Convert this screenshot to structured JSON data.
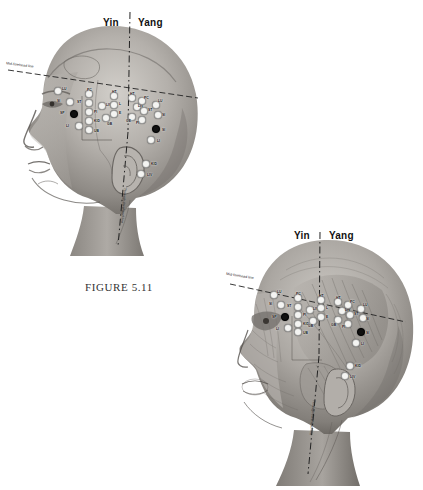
{
  "page": {
    "background": "#ffffff",
    "figure_caption": "FIGURE 5.11"
  },
  "labels": {
    "yin": "Yin",
    "yang": "Yang",
    "mid_forehead_line": "Mid-forehead line",
    "through_forehead_line": "Through-forehead line"
  },
  "colors": {
    "point_light": "#f4f4f2",
    "point_dark": "#101010",
    "line": "#2b2b2b",
    "text": "#111111",
    "skin_light": "#c9c6c1",
    "skin_mid": "#9a9691",
    "skin_dark": "#6e6a65"
  },
  "figures": [
    {
      "id": "figure-top",
      "view": "surface-anatomy-lateral-head",
      "caption": "FIGURE 5.11",
      "points": [
        {
          "label": "LU",
          "x": 57,
          "y": 90,
          "tone": "light",
          "lx": 62,
          "ly": 87
        },
        {
          "label": "SI",
          "x": 69,
          "y": 101,
          "tone": "light",
          "lx": 57,
          "ly": 99
        },
        {
          "label": "SP",
          "x": 73,
          "y": 113,
          "tone": "dark",
          "lx": 60,
          "ly": 111
        },
        {
          "label": "LI",
          "x": 78,
          "y": 125,
          "tone": "light",
          "lx": 66,
          "ly": 124
        },
        {
          "label": "PC",
          "x": 88,
          "y": 93,
          "tone": "light",
          "lx": 87,
          "ly": 88
        },
        {
          "label": "ST",
          "x": 88,
          "y": 102,
          "tone": "light",
          "lx": 77,
          "ly": 100
        },
        {
          "label": "PI",
          "x": 88,
          "y": 111,
          "tone": "light",
          "lx": 94,
          "ly": 110
        },
        {
          "label": "KID",
          "x": 88,
          "y": 120,
          "tone": "light",
          "lx": 94,
          "ly": 119
        },
        {
          "label": "UB",
          "x": 88,
          "y": 129,
          "tone": "light",
          "lx": 94,
          "ly": 129
        },
        {
          "label": "LIV",
          "x": 101,
          "y": 105,
          "tone": "light",
          "lx": 106,
          "ly": 103
        },
        {
          "label": "GB",
          "x": 105,
          "y": 117,
          "tone": "light",
          "lx": 107,
          "ly": 122
        },
        {
          "label": "HT",
          "x": 113,
          "y": 95,
          "tone": "light",
          "lx": 112,
          "ly": 90
        },
        {
          "label": "L",
          "x": 113,
          "y": 104,
          "tone": "light",
          "lx": 119,
          "ly": 102
        },
        {
          "label": "E",
          "x": 113,
          "y": 113,
          "tone": "light",
          "lx": 119,
          "ly": 111
        },
        {
          "label": "HT",
          "x": 131,
          "y": 97,
          "tone": "light",
          "lx": 130,
          "ly": 92
        },
        {
          "label": "LIV",
          "x": 136,
          "y": 106,
          "tone": "light",
          "lx": 138,
          "ly": 104
        },
        {
          "label": "GE",
          "x": 131,
          "y": 116,
          "tone": "light",
          "lx": 126,
          "ly": 119
        },
        {
          "label": "PC",
          "x": 141,
          "y": 100,
          "tone": "light",
          "lx": 144,
          "ly": 96
        },
        {
          "label": "ST",
          "x": 143,
          "y": 110,
          "tone": "light",
          "lx": 148,
          "ly": 108
        },
        {
          "label": "PI",
          "x": 141,
          "y": 119,
          "tone": "light",
          "lx": 136,
          "ly": 121
        },
        {
          "label": "LU",
          "x": 155,
          "y": 104,
          "tone": "light",
          "lx": 158,
          "ly": 99
        },
        {
          "label": "SI",
          "x": 157,
          "y": 114,
          "tone": "light",
          "lx": 162,
          "ly": 113
        },
        {
          "label": "SI",
          "x": 155,
          "y": 128,
          "tone": "dark",
          "lx": 162,
          "ly": 128
        },
        {
          "label": "LI",
          "x": 150,
          "y": 139,
          "tone": "light",
          "lx": 157,
          "ly": 139
        },
        {
          "label": "KID",
          "x": 145,
          "y": 163,
          "tone": "light",
          "lx": 151,
          "ly": 162
        },
        {
          "label": "LIV",
          "x": 140,
          "y": 173,
          "tone": "light",
          "lx": 147,
          "ly": 173
        }
      ]
    },
    {
      "id": "figure-bottom",
      "view": "muscular-anatomy-lateral-head",
      "caption": "",
      "points": [
        {
          "label": "LU",
          "x": 273,
          "y": 294,
          "tone": "light",
          "lx": 277,
          "ly": 290
        },
        {
          "label": "SI",
          "x": 280,
          "y": 304,
          "tone": "light",
          "lx": 269,
          "ly": 302
        },
        {
          "label": "SP",
          "x": 284,
          "y": 316,
          "tone": "dark",
          "lx": 272,
          "ly": 315
        },
        {
          "label": "LI",
          "x": 287,
          "y": 327,
          "tone": "light",
          "lx": 276,
          "ly": 327
        },
        {
          "label": "PC",
          "x": 297,
          "y": 297,
          "tone": "light",
          "lx": 296,
          "ly": 292
        },
        {
          "label": "ST",
          "x": 297,
          "y": 306,
          "tone": "light",
          "lx": 287,
          "ly": 304
        },
        {
          "label": "PI",
          "x": 297,
          "y": 314,
          "tone": "light",
          "lx": 303,
          "ly": 313
        },
        {
          "label": "KID",
          "x": 297,
          "y": 323,
          "tone": "light",
          "lx": 303,
          "ly": 322
        },
        {
          "label": "UB",
          "x": 297,
          "y": 331,
          "tone": "light",
          "lx": 303,
          "ly": 331
        },
        {
          "label": "LIV",
          "x": 309,
          "y": 309,
          "tone": "light",
          "lx": 313,
          "ly": 307
        },
        {
          "label": "GB",
          "x": 312,
          "y": 320,
          "tone": "light",
          "lx": 308,
          "ly": 324
        },
        {
          "label": "HT",
          "x": 320,
          "y": 299,
          "tone": "light",
          "lx": 319,
          "ly": 294
        },
        {
          "label": "L",
          "x": 320,
          "y": 307,
          "tone": "light",
          "lx": 326,
          "ly": 306
        },
        {
          "label": "E",
          "x": 320,
          "y": 316,
          "tone": "light",
          "lx": 326,
          "ly": 315
        },
        {
          "label": "HT",
          "x": 337,
          "y": 301,
          "tone": "light",
          "lx": 336,
          "ly": 296
        },
        {
          "label": "LIV",
          "x": 341,
          "y": 310,
          "tone": "light",
          "lx": 345,
          "ly": 308
        },
        {
          "label": "GB",
          "x": 337,
          "y": 319,
          "tone": "light",
          "lx": 331,
          "ly": 323
        },
        {
          "label": "PC",
          "x": 347,
          "y": 304,
          "tone": "light",
          "lx": 350,
          "ly": 300
        },
        {
          "label": "ST",
          "x": 349,
          "y": 314,
          "tone": "light",
          "lx": 354,
          "ly": 312
        },
        {
          "label": "PI",
          "x": 347,
          "y": 323,
          "tone": "light",
          "lx": 342,
          "ly": 325
        },
        {
          "label": "LU",
          "x": 360,
          "y": 308,
          "tone": "light",
          "lx": 363,
          "ly": 303
        },
        {
          "label": "SI",
          "x": 362,
          "y": 317,
          "tone": "light",
          "lx": 366,
          "ly": 317
        },
        {
          "label": "SI",
          "x": 360,
          "y": 331,
          "tone": "dark",
          "lx": 366,
          "ly": 331
        },
        {
          "label": "LI",
          "x": 355,
          "y": 342,
          "tone": "light",
          "lx": 361,
          "ly": 342
        },
        {
          "label": "KID",
          "x": 349,
          "y": 365,
          "tone": "light",
          "lx": 355,
          "ly": 364
        },
        {
          "label": "LIV",
          "x": 344,
          "y": 375,
          "tone": "light",
          "lx": 350,
          "ly": 375
        }
      ]
    }
  ]
}
